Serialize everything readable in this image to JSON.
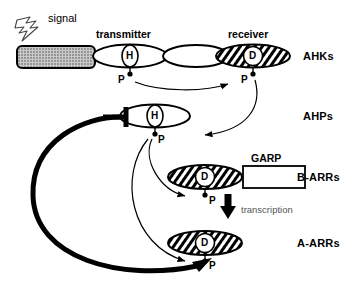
{
  "diagram": {
    "title_elements": {
      "signal": "signal",
      "transmitter": "transmitter",
      "receiver": "receiver",
      "garp": "GARP",
      "transcription": "transcription"
    },
    "row_labels": [
      {
        "id": "ahks",
        "text": "AHKs"
      },
      {
        "id": "ahps",
        "text": "AHPs"
      },
      {
        "id": "barrs",
        "text": "B-ARRs"
      },
      {
        "id": "aarrs",
        "text": "A-ARRs"
      }
    ],
    "residues": [
      {
        "id": "transmitter-h",
        "text": "H"
      },
      {
        "id": "receiver-d",
        "text": "D"
      },
      {
        "id": "ahp-h",
        "text": "H"
      },
      {
        "id": "barr-d",
        "text": "D"
      },
      {
        "id": "aarr-d",
        "text": "D"
      }
    ],
    "phosphates": [
      {
        "id": "p-transmitter",
        "text": "P"
      },
      {
        "id": "p-receiver",
        "text": "P"
      },
      {
        "id": "p-ahp",
        "text": "P"
      },
      {
        "id": "p-barr",
        "text": "P"
      },
      {
        "id": "p-aarr",
        "text": "P"
      }
    ],
    "colors": {
      "stroke": "#000000",
      "background": "#ffffff",
      "membrane_fill": "#b9b9b9",
      "transcription_text": "#555555"
    }
  }
}
